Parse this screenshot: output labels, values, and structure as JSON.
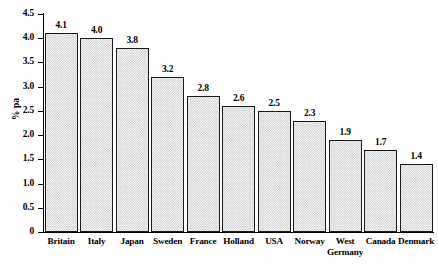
{
  "chart_data": {
    "type": "bar",
    "title": "",
    "subtitle": "",
    "xlabel": "",
    "ylabel": "% pa",
    "categories": [
      "Britain",
      "Italy",
      "Japan",
      "Sweden",
      "France",
      "Holland",
      "USA",
      "West Germany",
      "Norway",
      "Canada",
      "Denmark"
    ],
    "category_order": [
      "Britain",
      "Italy",
      "Japan",
      "Sweden",
      "France",
      "Holland",
      "USA",
      "Norway",
      "West Germany",
      "Canada",
      "Denmark"
    ],
    "values": [
      4.1,
      4.0,
      3.8,
      3.2,
      2.8,
      2.6,
      2.5,
      2.3,
      1.9,
      1.7,
      1.4
    ],
    "data_labels": [
      "4.1",
      "4.0",
      "3.8",
      "3.2",
      "2.8",
      "2.6",
      "2.5",
      "2.3",
      "1.9",
      "1.7",
      "1.4"
    ],
    "ylim": [
      0,
      4.5
    ],
    "ytick_values": [
      0,
      0.5,
      1.0,
      1.5,
      2.0,
      2.5,
      3.0,
      3.5,
      4.0,
      4.5
    ],
    "ytick_labels": [
      "0",
      "0.5",
      "1.0",
      "1.5",
      "2.0",
      "2.5",
      "3.0",
      "3.5",
      "4.0",
      "4.5"
    ],
    "grid": false,
    "legend": null,
    "legend_position": "none",
    "annotations": [],
    "bar_fill_color": "#d2d2d2",
    "bar_edge_color": "#1a1a1a",
    "background_color": "#ffffff",
    "bar_fill_pattern": "fine-checkerboard-dither",
    "orientation": "vertical"
  },
  "axis": {
    "y_title": "% pa",
    "zero_label": "0"
  }
}
